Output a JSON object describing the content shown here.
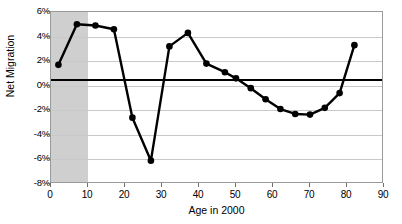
{
  "chart_data": {
    "type": "line",
    "title": "",
    "xlabel": "Age in 2000",
    "ylabel": "Net Migration",
    "xlim": [
      0,
      90
    ],
    "ylim": [
      -8,
      6
    ],
    "xticks": [
      0,
      10,
      20,
      30,
      40,
      50,
      60,
      70,
      80,
      90
    ],
    "ytick_labels": [
      "6%",
      "4%",
      "2%",
      "0%",
      "-2%",
      "-4%",
      "-6%",
      "-8%"
    ],
    "yticks": [
      6,
      4,
      2,
      0,
      -2,
      -4,
      -6,
      -8
    ],
    "grid": true,
    "legend": null,
    "marker": "filled-circle",
    "line_color": "#000000",
    "shaded_band": {
      "x_start": 0,
      "x_end": 10,
      "color": "#cfcfcf"
    },
    "reference_line": {
      "y": 0.45,
      "color": "#000000"
    },
    "x": [
      2,
      7,
      12,
      17,
      22,
      27,
      32,
      37,
      42,
      47,
      52,
      57,
      62,
      67,
      72,
      77,
      82
    ],
    "values": [
      1.7,
      5.0,
      4.9,
      4.6,
      -2.6,
      -6.1,
      3.2,
      4.3,
      1.8,
      1.1,
      0.5,
      -0.9,
      -2.0,
      -2.4,
      -2.3,
      -1.4,
      0.7
    ],
    "series": [
      {
        "name": "Net Migration",
        "points": [
          {
            "x": 2,
            "y": 1.7
          },
          {
            "x": 7,
            "y": 5.0
          },
          {
            "x": 12,
            "y": 4.9
          },
          {
            "x": 17,
            "y": 4.6
          },
          {
            "x": 22,
            "y": -2.6
          },
          {
            "x": 27,
            "y": -6.1
          },
          {
            "x": 32,
            "y": 3.2
          },
          {
            "x": 37,
            "y": 4.3
          },
          {
            "x": 42,
            "y": 1.8
          },
          {
            "x": 47,
            "y": 1.1
          },
          {
            "x": 50,
            "y": 0.6
          },
          {
            "x": 54,
            "y": -0.2
          },
          {
            "x": 58,
            "y": -1.1
          },
          {
            "x": 62,
            "y": -1.9
          },
          {
            "x": 66,
            "y": -2.3
          },
          {
            "x": 70,
            "y": -2.35
          },
          {
            "x": 74,
            "y": -1.8
          },
          {
            "x": 78,
            "y": -0.6
          },
          {
            "x": 82,
            "y": 3.3
          }
        ]
      }
    ]
  }
}
